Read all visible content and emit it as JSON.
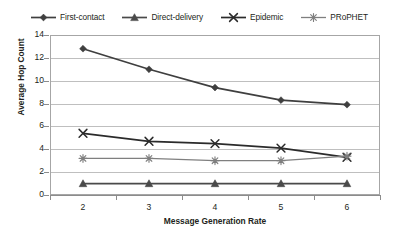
{
  "chart_data": {
    "type": "line",
    "title": "",
    "xlabel": "Message Generation Rate",
    "ylabel": "Average Hop Count",
    "categories": [
      "2",
      "3",
      "4",
      "5",
      "6"
    ],
    "x": [
      2,
      3,
      4,
      5,
      6
    ],
    "ylim": [
      0,
      14
    ],
    "yticks": [
      0,
      2,
      4,
      6,
      8,
      10,
      12,
      14
    ],
    "xlim": [
      1.5,
      6.5
    ],
    "grid": "horizontal",
    "legend_position": "top",
    "series": [
      {
        "name": "First-contact",
        "marker": "diamond",
        "color": "#3f3f3f",
        "values": [
          12.8,
          11.0,
          9.4,
          8.3,
          7.9
        ]
      },
      {
        "name": "Direct-delivery",
        "marker": "triangle",
        "color": "#4a4a4a",
        "values": [
          1.0,
          1.0,
          1.0,
          1.0,
          1.0
        ]
      },
      {
        "name": "Epidemic",
        "marker": "cross-x",
        "color": "#2b2b2b",
        "values": [
          5.4,
          4.7,
          4.5,
          4.1,
          3.3
        ]
      },
      {
        "name": "PRoPHET",
        "marker": "asterisk",
        "color": "#7f7f7f",
        "values": [
          3.2,
          3.2,
          3.0,
          3.0,
          3.4
        ]
      }
    ]
  },
  "legend": {
    "items": [
      {
        "label": "First-contact",
        "marker": "diamond",
        "color": "#3f3f3f"
      },
      {
        "label": "Direct-delivery",
        "marker": "triangle",
        "color": "#4a4a4a"
      },
      {
        "label": "Epidemic",
        "marker": "cross-x",
        "color": "#2b2b2b"
      },
      {
        "label": "PRoPHET",
        "marker": "asterisk",
        "color": "#7f7f7f"
      }
    ]
  },
  "axes": {
    "y_tick_labels": [
      "14",
      "12",
      "10",
      "8",
      "6",
      "4",
      "2",
      "0"
    ],
    "x_tick_labels": [
      "2",
      "3",
      "4",
      "5",
      "6"
    ],
    "y_axis_title": "Average Hop Count",
    "x_axis_title": "Message Generation Rate"
  },
  "colors": {
    "gridline": "#bfbfbf",
    "axis": "#8c8c8c",
    "text": "#231f20",
    "background": "#ffffff"
  }
}
